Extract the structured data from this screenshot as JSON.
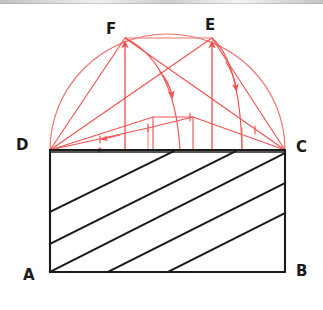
{
  "figure": {
    "type": "hand-drawn-geometry-diagram",
    "canvas": {
      "width": 323,
      "height": 310
    },
    "colors": {
      "construction": "#ef5350",
      "construction_light": "#f28b86",
      "ink": "#1b1b1b",
      "background": "#ffffff"
    },
    "labels": [
      {
        "text": "A",
        "x": 23,
        "y": 268,
        "name": "point-label-a"
      },
      {
        "text": "B",
        "x": 296,
        "y": 264,
        "name": "point-label-b"
      },
      {
        "text": "C",
        "x": 296,
        "y": 140,
        "name": "point-label-c"
      },
      {
        "text": "D",
        "x": 16,
        "y": 138,
        "name": "point-label-d"
      },
      {
        "text": "E",
        "x": 205,
        "y": 18,
        "name": "point-label-e"
      },
      {
        "text": "F",
        "x": 106,
        "y": 22,
        "name": "point-label-f"
      }
    ],
    "points": {
      "A": {
        "x": 50,
        "y": 272
      },
      "B": {
        "x": 285,
        "y": 272
      },
      "C": {
        "x": 285,
        "y": 150
      },
      "D": {
        "x": 50,
        "y": 150
      },
      "E": {
        "x": 212,
        "y": 38
      },
      "F": {
        "x": 125,
        "y": 38
      }
    },
    "rectangle": {
      "name": "rectangle-abcd",
      "vertices": "50,272 50,150 285,150 285,272",
      "stroke": "#1b1b1b",
      "stroke_width": 2.1
    },
    "hatching": {
      "name": "diagonal-hatch-lines",
      "count": 6,
      "stroke": "#1b1b1b",
      "stroke_width": 2.0,
      "lines": [
        {
          "x1": 50,
          "y1": 212,
          "x2": 172,
          "y2": 150
        },
        {
          "x1": 50,
          "y1": 243,
          "x2": 233,
          "y2": 150
        },
        {
          "x1": 50,
          "y1": 272,
          "x2": 285,
          "y2": 152
        },
        {
          "x1": 108,
          "y1": 272,
          "x2": 285,
          "y2": 182
        },
        {
          "x1": 168,
          "y1": 272,
          "x2": 285,
          "y2": 212
        },
        {
          "x1": 75,
          "y1": 150,
          "x2": 285,
          "y2": 150
        }
      ]
    },
    "semicircle": {
      "name": "semicircle-on-dc",
      "center": {
        "x": 167.5,
        "y": 150
      },
      "radius": 117.5,
      "apex_y": 34,
      "stroke": "#ef5350"
    },
    "chords": [
      {
        "name": "chord-d-f",
        "from": "D",
        "to": "F"
      },
      {
        "name": "chord-d-e",
        "from": "D",
        "to": "E"
      },
      {
        "name": "chord-f-c",
        "from": "F",
        "to": "C"
      },
      {
        "name": "chord-e-c",
        "from": "E",
        "to": "C"
      },
      {
        "name": "chord-f-e",
        "from": "F",
        "to": "E"
      }
    ],
    "vertical_arrows": [
      {
        "name": "arrow-up-to-f",
        "x": 125,
        "from_y": 150,
        "to_y": 38
      },
      {
        "name": "arrow-up-to-e",
        "x": 212,
        "from_y": 150,
        "to_y": 38
      }
    ],
    "rotation_arcs": [
      {
        "name": "rotation-arc-f-to-baseline",
        "from": "F",
        "to_x": 180,
        "to_y": 150
      },
      {
        "name": "rotation-arc-e-to-baseline",
        "from": "E",
        "to_x": 242,
        "to_y": 150
      }
    ],
    "inner_polylines": [
      {
        "name": "inner-upper-polyline",
        "points": "50,150 153,117 193,117 285,150"
      },
      {
        "name": "inner-lower-polyline",
        "points": "50,150 148,128 193,117"
      },
      {
        "name": "inner-base-polyline",
        "points": "50,150 127,150 212,150 285,150"
      }
    ],
    "tick_marks": [
      {
        "name": "tick-mark-1",
        "x": 100,
        "y": 140
      },
      {
        "name": "tick-mark-2",
        "x": 148,
        "y": 128
      },
      {
        "name": "tick-mark-3",
        "x": 190,
        "y": 117
      },
      {
        "name": "tick-mark-4",
        "x": 255,
        "y": 130
      }
    ]
  }
}
